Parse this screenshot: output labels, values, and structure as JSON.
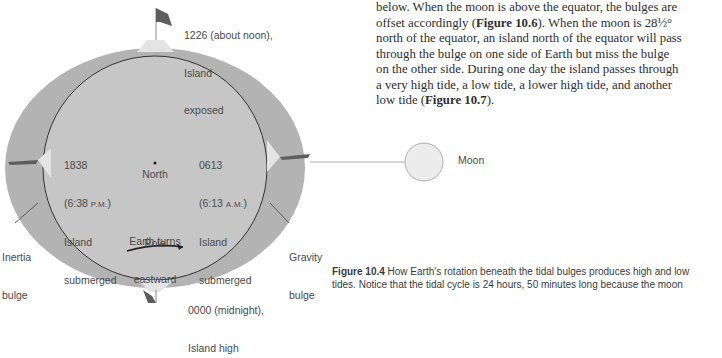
{
  "diagram": {
    "top_label": {
      "line1": "1226 (about noon),",
      "line2": "Island",
      "line3": "exposed"
    },
    "left_label": {
      "time": "1838",
      "clock": "(6:38 ",
      "clock_suffix": "P.M.",
      "clock_close": ")",
      "line3": "Island",
      "line4": "submerged"
    },
    "right_label": {
      "time": "0613",
      "clock": "(6:13 ",
      "clock_suffix": "A.M.",
      "clock_close": ")",
      "line3": "Island",
      "line4": "submerged"
    },
    "center_label": {
      "line1": "North",
      "line2": "Pole"
    },
    "rotation_label": {
      "line1": "Earth turns",
      "line2": "eastward"
    },
    "inertia_label": {
      "line1": "Inertia",
      "line2": "bulge"
    },
    "gravity_label": {
      "line1": "Gravity",
      "line2": "bulge"
    },
    "bottom_label": {
      "line1": "0000 (midnight),",
      "line2": "Island high"
    },
    "moon_label": "Moon",
    "colors": {
      "ocean_bulge": "#b3b3b3",
      "earth": "#c6c6c6",
      "island": "#e4e4e4",
      "moon": "#ececec",
      "outline": "#333333"
    }
  },
  "body_text": {
    "line1_pre": "below. When the moon is above the equator, the bulges are",
    "line2_pre": "offset accordingly (",
    "fig_ref_1": "Figure 10.6",
    "line2_post": "). When the moon is 28½°",
    "line3": "north of the equator, an island north of the equator will pass",
    "line4": "through the bulge on one side of Earth but miss the bulge",
    "line5": "on the other side. During one day the island passes through",
    "line6": "a very high tide, a low tide, a lower high tide, and another",
    "line7_pre": "low tide (",
    "fig_ref_2": "Figure 10.7",
    "line7_post": ")."
  },
  "caption": {
    "label": "Figure 10.4",
    "line1": " How Earth's rotation beneath the tidal bulges produces high and low",
    "line2": "tides. Notice that the tidal cycle is 24 hours, 50 minutes long because the moon"
  }
}
